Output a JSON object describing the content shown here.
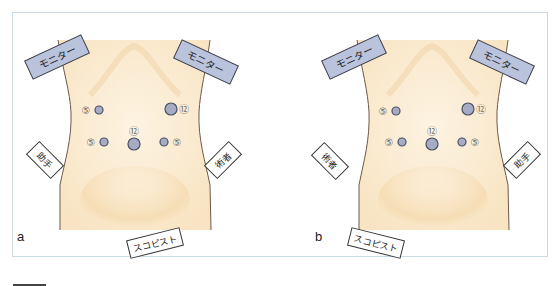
{
  "figure": {
    "panels": [
      {
        "id": "a",
        "letter": "a",
        "monitor_left": "モニター",
        "monitor_right": "モニター",
        "assistant_side": "left",
        "left_role": "助手",
        "right_role": "術者",
        "scopist": "スコピスト",
        "ports": [
          {
            "size": "5",
            "label": "⑤",
            "position": "upper-left"
          },
          {
            "size": "12",
            "label": "⑫",
            "position": "upper-right"
          },
          {
            "size": "5",
            "label": "⑤",
            "position": "lower-left"
          },
          {
            "size": "12",
            "label": "⑫",
            "position": "umbilical"
          },
          {
            "size": "5",
            "label": "⑤",
            "position": "lower-right"
          }
        ]
      },
      {
        "id": "b",
        "letter": "b",
        "monitor_left": "モニター",
        "monitor_right": "モニター",
        "left_role": "術者",
        "right_role": "助手",
        "scopist": "スコピスト",
        "ports": [
          {
            "size": "5",
            "label": "⑤",
            "position": "upper-left"
          },
          {
            "size": "12",
            "label": "⑫",
            "position": "upper-right"
          },
          {
            "size": "5",
            "label": "⑤",
            "position": "lower-left"
          },
          {
            "size": "12",
            "label": "⑫",
            "position": "umbilical"
          },
          {
            "size": "5",
            "label": "⑤",
            "position": "lower-right"
          }
        ]
      }
    ],
    "colors": {
      "skin": "#fbecd3",
      "skin_shade": "#f3d9ae",
      "outline": "#6b5a4a",
      "monitor_fill": "#b9c3dc",
      "port_fill": "#a6acc4",
      "port_stroke": "#4a4f66",
      "frame_border": "#c9dbe6"
    }
  }
}
